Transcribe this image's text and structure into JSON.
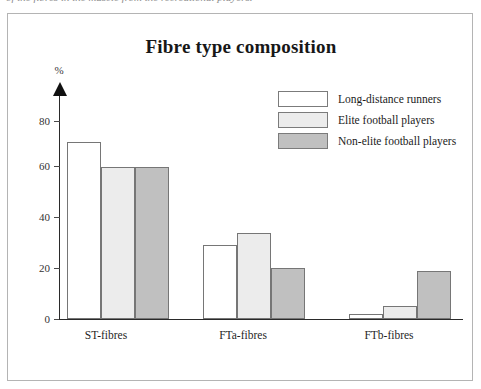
{
  "caption": {
    "text": "of the fibres in the muscle from the recreational players."
  },
  "figure": {
    "title": "Fibre type composition",
    "frame_color": "#b4b4b4"
  },
  "axes": {
    "y_unit": "%",
    "y_ticks": [
      "80",
      "60",
      "40",
      "20",
      "0"
    ],
    "x_labels": [
      "ST-fibres",
      "FTa-fibres",
      "FTb-fibres"
    ]
  },
  "legend": {
    "items": [
      {
        "label": "Long-distance runners",
        "color": "#ffffff"
      },
      {
        "label": "Elite football players",
        "color": "#ececec"
      },
      {
        "label": "Non-elite football players",
        "color": "#c0c0c0"
      }
    ]
  },
  "chart_data": {
    "type": "bar",
    "title": "Fibre type composition",
    "xlabel": "",
    "ylabel": "%",
    "ylim": [
      0,
      80
    ],
    "yticks": [
      0,
      20,
      40,
      60,
      80
    ],
    "grid": false,
    "legend_position": "top-right",
    "categories": [
      "ST-fibres",
      "FTa-fibres",
      "FTb-fibres"
    ],
    "series": [
      {
        "name": "Long-distance runners",
        "color": "#ffffff",
        "values": [
          70,
          29,
          2
        ]
      },
      {
        "name": "Elite football players",
        "color": "#ececec",
        "values": [
          60,
          34,
          5
        ]
      },
      {
        "name": "Non-elite football players",
        "color": "#c0c0c0",
        "values": [
          60,
          20,
          19
        ]
      }
    ]
  }
}
